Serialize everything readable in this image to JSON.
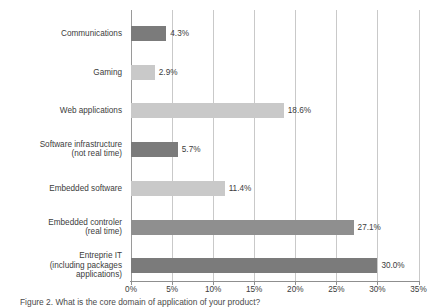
{
  "chart_data": {
    "type": "bar",
    "orientation": "horizontal",
    "title": "",
    "xlabel": "",
    "ylabel": "",
    "xlim": [
      0,
      35
    ],
    "xticks": [
      "0%",
      "5%",
      "10%",
      "15%",
      "20%",
      "25%",
      "30%",
      "35%"
    ],
    "xtick_values": [
      0,
      5,
      10,
      15,
      20,
      25,
      30,
      35
    ],
    "grid": true,
    "legend": "none",
    "categories": [
      "Communications",
      "Gaming",
      "Web applications",
      "Software infrastructure\n(not real time)",
      "Embedded software",
      "Embedded controler\n(real time)",
      "Entreprie IT\n(including packages\napplications)"
    ],
    "values": [
      4.3,
      2.9,
      18.6,
      5.7,
      11.4,
      27.1,
      30.0
    ],
    "value_labels": [
      "4.3%",
      "2.9%",
      "18.6%",
      "5.7%",
      "11.4%",
      "27.1%",
      "30.0%"
    ],
    "bar_colors": [
      "dark",
      "light",
      "light",
      "dark",
      "light",
      "mid",
      "dark"
    ],
    "colors": {
      "dark": "#7b7b7b",
      "light": "#c9c9c9",
      "mid": "#8f8f8f",
      "gridline": "#c9c9c9",
      "axis": "#8f8f8f",
      "text": "#3c3c3c"
    }
  },
  "caption": {
    "text": "Figure 2. What is the core domain of application of your product?"
  }
}
